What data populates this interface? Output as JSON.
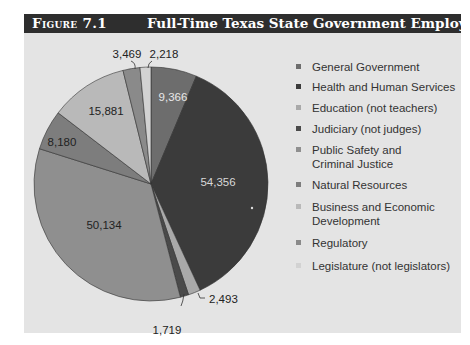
{
  "figure": {
    "label": "Figure 7.1",
    "title": "Full-Time Texas State Government Employees"
  },
  "chart_data": {
    "type": "pie",
    "title": "Full-Time Texas State Government Employees",
    "start_angle": "12 o'clock, clockwise",
    "categories": [
      "General Government",
      "Health and Human Services",
      "Education (not teachers)",
      "Judiciary (not judges)",
      "Public Safety and Criminal Justice",
      "Natural Resources",
      "Business and Economic Development",
      "Regulatory",
      "Legislature (not legislators)"
    ],
    "values": [
      9366,
      54356,
      2493,
      1719,
      50134,
      8180,
      15881,
      3469,
      2218
    ],
    "value_labels": [
      "9,366",
      "54,356",
      "2,493",
      "1,719",
      "50,134",
      "8,180",
      "15,881",
      "3,469",
      "2,218"
    ],
    "colors": [
      "#6d6d6d",
      "#3b3b3b",
      "#a9a9a9",
      "#4a4a4a",
      "#8f8f8f",
      "#7d7d7d",
      "#b9b9b9",
      "#8a8a8a",
      "#d2d2d2"
    ],
    "legend_position": "right"
  },
  "legend": {
    "items": [
      {
        "line1": "General Government",
        "line2": ""
      },
      {
        "line1": "Health and Human Services",
        "line2": ""
      },
      {
        "line1": "Education (not teachers)",
        "line2": ""
      },
      {
        "line1": "Judiciary (not judges)",
        "line2": ""
      },
      {
        "line1": "Public Safety and",
        "line2": "Criminal Justice"
      },
      {
        "line1": "Natural Resources",
        "line2": ""
      },
      {
        "line1": "Business and Economic",
        "line2": "Development"
      },
      {
        "line1": "Regulatory",
        "line2": ""
      },
      {
        "line1": "Legislature (not legislators)",
        "line2": ""
      }
    ]
  }
}
